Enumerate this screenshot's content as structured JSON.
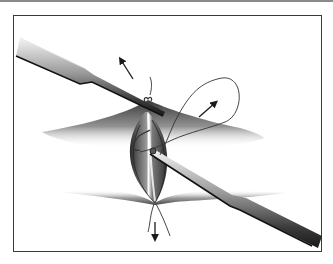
{
  "figure": {
    "colors": {
      "frame": "#3a3a3a",
      "rule": "#8a8a8a",
      "tissue_dark": "#3c3c3c",
      "instrument": "#6a6a6a",
      "arrow": "#1a1a1a"
    },
    "elements": {
      "instruments": [
        "upper-left forceps",
        "lower-right forceps"
      ],
      "arrows": [
        "up-left arrow",
        "up-right arrow",
        "down arrow"
      ],
      "suture": "suture loop with knot"
    }
  }
}
